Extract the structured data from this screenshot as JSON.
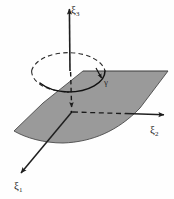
{
  "figure": {
    "background_color": "#fefefe",
    "plane_fill_color": "#9a9a9a",
    "plane_edge_color": "#3a3a3a",
    "line_color": "#1f1f1f",
    "labels": {
      "axis3": {
        "symbol": "ξ",
        "subscript": "3",
        "name": "xi-3-axis-label"
      },
      "axis2": {
        "symbol": "ξ",
        "subscript": "2",
        "name": "xi-2-axis-label"
      },
      "axis1": {
        "symbol": "ξ",
        "subscript": "1",
        "name": "xi-1-axis-label"
      },
      "curve": {
        "symbol": "γ",
        "name": "gamma-curve-label"
      }
    },
    "geometry": {
      "origin": {
        "x": 72,
        "y": 112
      },
      "axis3_tip": {
        "x": 69,
        "y": 6
      },
      "axis2_tip": {
        "x": 167,
        "y": 119
      },
      "axis1_tip": {
        "x": 18,
        "y": 176
      },
      "ellipse_center": {
        "x": 68,
        "y": 71
      },
      "ellipse_rx": 37,
      "ellipse_ry": 21,
      "curve_arrow": {
        "x": 100,
        "y": 76
      }
    },
    "elements": {
      "plane": "shaded-plane",
      "curve_solid": "gamma-curve-front-solid",
      "curve_dashed": "gamma-curve-back-dashed",
      "dropline": "vertical-dashed-dropline",
      "dashed_axis2_segment": "xi2-dashed-segment"
    }
  }
}
